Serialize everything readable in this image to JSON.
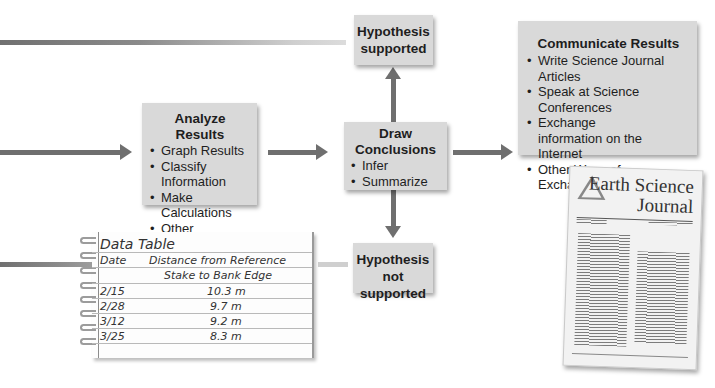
{
  "diagram": {
    "analyze": {
      "title": "Analyze Results",
      "items": [
        "Graph Results",
        "Classify Information",
        "Make Calculations",
        "Other Processes"
      ]
    },
    "conclusions": {
      "title_line1": "Draw",
      "title_line2": "Conclusions",
      "items": [
        "Infer",
        "Summarize"
      ]
    },
    "hypothesis_supported": {
      "line1": "Hypothesis",
      "line2": "supported"
    },
    "hypothesis_not_supported": {
      "line1": "Hypothesis",
      "line2": "not supported"
    },
    "communicate": {
      "title": "Communicate Results",
      "items": [
        "Write Science Journal Articles",
        "Speak at Science Conferences",
        "Exchange information on the Internet",
        "Other Ways of Exchanging Information"
      ]
    },
    "colors": {
      "box": "#d9d9d9",
      "arrow": "#6f6f6f",
      "text": "#1e1e1e"
    }
  },
  "data_table": {
    "title": "Data Table",
    "headers": [
      "Date",
      "Distance from Reference",
      "Stake to Bank Edge"
    ],
    "rows": [
      {
        "date": "2/15",
        "distance": "10.3 m"
      },
      {
        "date": "2/28",
        "distance": "9.7 m"
      },
      {
        "date": "3/12",
        "distance": "9.2 m"
      },
      {
        "date": "3/25",
        "distance": "8.3 m"
      }
    ]
  },
  "journal": {
    "title_line1": "Earth Science",
    "title_line2": "Journal"
  }
}
